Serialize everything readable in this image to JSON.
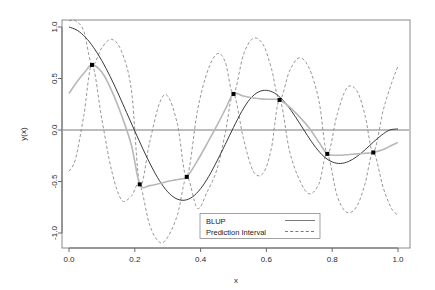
{
  "chart_data": {
    "type": "line",
    "title": "",
    "xlabel": "x",
    "ylabel": "y(x)",
    "xlim": [
      0.0,
      1.0
    ],
    "ylim": [
      -1.0,
      1.0
    ],
    "xticks": [
      "0.0",
      "0.2",
      "0.4",
      "0.6",
      "0.8",
      "1.0"
    ],
    "xtick_values": [
      0.0,
      0.2,
      0.4,
      0.6,
      0.8,
      1.0
    ],
    "yticks": [
      "1.0",
      "0.5",
      "0.0",
      "-0.5",
      "-1.0"
    ],
    "ytick_values": [
      1.0,
      0.5,
      0.0,
      -0.5,
      -1.0
    ],
    "grid": false,
    "zero_line": 0.0,
    "legend": {
      "position": "bottom-center",
      "entries": [
        {
          "label": "BLUP",
          "style": "solid",
          "color": "#6b6b6b"
        },
        {
          "label": "Prediction Interval",
          "style": "dashed",
          "color": "#6b6b6b"
        }
      ]
    },
    "series": [
      {
        "name": "true-function",
        "style": "solid",
        "color": "#3a3a3a",
        "x": [
          0.0,
          0.025,
          0.05,
          0.075,
          0.1,
          0.125,
          0.15,
          0.175,
          0.2,
          0.225,
          0.25,
          0.275,
          0.3,
          0.325,
          0.35,
          0.375,
          0.4,
          0.425,
          0.45,
          0.475,
          0.5,
          0.525,
          0.55,
          0.575,
          0.6,
          0.625,
          0.65,
          0.675,
          0.7,
          0.725,
          0.75,
          0.775,
          0.8,
          0.825,
          0.85,
          0.875,
          0.9,
          0.925,
          0.95,
          0.975,
          1.0
        ],
        "y": [
          1.0,
          0.968,
          0.9,
          0.8,
          0.672,
          0.52,
          0.35,
          0.17,
          -0.01,
          -0.186,
          -0.35,
          -0.492,
          -0.6,
          -0.665,
          -0.682,
          -0.65,
          -0.57,
          -0.45,
          -0.3,
          -0.14,
          0.025,
          0.18,
          0.3,
          0.368,
          0.385,
          0.358,
          0.29,
          0.19,
          0.07,
          -0.055,
          -0.17,
          -0.258,
          -0.31,
          -0.325,
          -0.305,
          -0.258,
          -0.192,
          -0.118,
          -0.05,
          0.0,
          0.01
        ]
      },
      {
        "name": "blup",
        "style": "solid",
        "color": "#b8b8b8",
        "x": [
          0.0,
          0.025,
          0.05,
          0.07,
          0.1,
          0.13,
          0.16,
          0.19,
          0.215,
          0.245,
          0.275,
          0.305,
          0.33,
          0.358,
          0.39,
          0.42,
          0.45,
          0.475,
          0.5,
          0.53,
          0.56,
          0.59,
          0.615,
          0.64,
          0.67,
          0.7,
          0.73,
          0.76,
          0.785,
          0.815,
          0.845,
          0.875,
          0.9,
          0.925,
          0.955,
          0.98,
          1.0
        ],
        "y": [
          0.355,
          0.47,
          0.57,
          0.632,
          0.56,
          0.38,
          0.14,
          -0.15,
          -0.528,
          -0.54,
          -0.52,
          -0.495,
          -0.48,
          -0.455,
          -0.3,
          -0.13,
          0.045,
          0.2,
          0.35,
          0.33,
          0.31,
          0.3,
          0.298,
          0.292,
          0.225,
          0.13,
          0.02,
          -0.12,
          -0.232,
          -0.245,
          -0.24,
          -0.232,
          -0.226,
          -0.218,
          -0.19,
          -0.15,
          -0.12
        ]
      }
    ],
    "prediction_interval": {
      "style": "dashed",
      "color": "#8a8a8a",
      "knots": [
        0.07,
        0.215,
        0.358,
        0.5,
        0.64,
        0.785,
        0.925
      ],
      "upper": {
        "x": [
          0.0,
          0.02,
          0.045,
          0.07,
          0.1,
          0.13,
          0.16,
          0.19,
          0.215,
          0.245,
          0.275,
          0.3,
          0.33,
          0.358,
          0.39,
          0.42,
          0.45,
          0.475,
          0.5,
          0.53,
          0.56,
          0.59,
          0.615,
          0.64,
          0.67,
          0.7,
          0.73,
          0.76,
          0.785,
          0.815,
          0.845,
          0.875,
          0.9,
          0.925,
          0.955,
          0.98,
          1.0
        ],
        "y": [
          1.06,
          1.06,
          0.96,
          0.632,
          0.8,
          0.88,
          0.76,
          0.38,
          -0.528,
          -0.12,
          0.26,
          0.33,
          0.05,
          -0.455,
          0.18,
          0.56,
          0.74,
          0.66,
          0.35,
          0.73,
          0.89,
          0.83,
          0.6,
          0.292,
          0.57,
          0.7,
          0.6,
          0.28,
          -0.232,
          0.15,
          0.41,
          0.38,
          0.14,
          -0.218,
          0.19,
          0.45,
          0.62
        ]
      },
      "lower": {
        "x": [
          0.0,
          0.02,
          0.045,
          0.07,
          0.1,
          0.13,
          0.16,
          0.19,
          0.215,
          0.245,
          0.275,
          0.3,
          0.33,
          0.358,
          0.39,
          0.42,
          0.45,
          0.475,
          0.5,
          0.53,
          0.56,
          0.59,
          0.615,
          0.64,
          0.67,
          0.7,
          0.73,
          0.76,
          0.785,
          0.815,
          0.845,
          0.875,
          0.9,
          0.925,
          0.955,
          0.98,
          1.0
        ],
        "y": [
          -0.4,
          -0.28,
          0.14,
          0.632,
          0.1,
          -0.4,
          -0.68,
          -0.64,
          -0.528,
          -0.92,
          -1.09,
          -1.04,
          -0.82,
          -0.455,
          -0.76,
          -0.6,
          -0.38,
          -0.03,
          0.35,
          -0.08,
          -0.4,
          -0.42,
          -0.18,
          0.292,
          -0.2,
          -0.48,
          -0.62,
          -0.52,
          -0.232,
          -0.64,
          -0.8,
          -0.74,
          -0.52,
          -0.218,
          -0.56,
          -0.76,
          -0.83
        ]
      }
    },
    "data_points": {
      "name": "design-points",
      "marker": "filled-square",
      "color": "#000000",
      "x": [
        0.07,
        0.215,
        0.358,
        0.5,
        0.64,
        0.785,
        0.925
      ],
      "y": [
        0.632,
        -0.528,
        -0.455,
        0.35,
        0.292,
        -0.232,
        -0.218
      ]
    }
  }
}
